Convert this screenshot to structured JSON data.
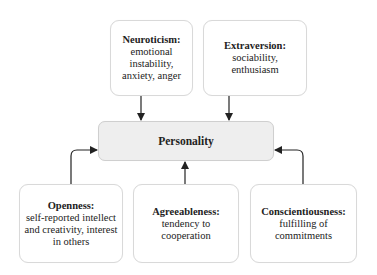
{
  "center": {
    "title": "Personality"
  },
  "traits": [
    {
      "id": "neuroticism",
      "title": "Neuroticism:",
      "lines": [
        "emotional instability,",
        "anxiety, anger"
      ]
    },
    {
      "id": "extraversion",
      "title": "Extraversion:",
      "lines": [
        "sociability, enthusiasm"
      ]
    },
    {
      "id": "openness",
      "title": "Openness:",
      "lines": [
        "self-reported intellect",
        "and creativity, interest",
        "in others"
      ]
    },
    {
      "id": "agreeableness",
      "title": "Agreeableness:",
      "lines": [
        "tendency to cooperation"
      ]
    },
    {
      "id": "conscientiousness",
      "title": "Conscientiousness:",
      "lines": [
        "fulfilling of",
        "commitments"
      ]
    }
  ],
  "colors": {
    "center_fill": "#eeeeee",
    "box_border": "#d9d9d9",
    "arrow": "#222222"
  }
}
